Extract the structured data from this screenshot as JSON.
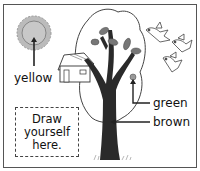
{
  "diagram": {
    "labels": {
      "sun": "yellow",
      "leaf": "green",
      "trunk": "brown"
    },
    "draw_box": {
      "line1": "Draw",
      "line2": "yourself",
      "line3": "here."
    },
    "elements": [
      "sun-icon",
      "treehouse-icon",
      "tree-icon",
      "leaf-icon",
      "bird-icon",
      "bird-icon",
      "bird-icon",
      "grass-icon"
    ]
  }
}
